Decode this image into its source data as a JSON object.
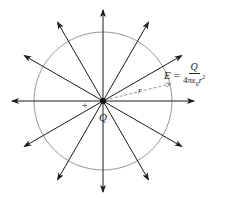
{
  "diagram": {
    "center": {
      "x": 103,
      "y": 101
    },
    "circle_radius": 69,
    "field_line_count": 12,
    "field_line_angles_deg": [
      0,
      30,
      60,
      90,
      120,
      150,
      180,
      210,
      240,
      270,
      300,
      330
    ],
    "line_length": 91,
    "colors": {
      "line": "#1a1a1a",
      "circle": "#8a8a8a",
      "radius": "#777777",
      "text": "#222222"
    },
    "labels": {
      "charge": "Q",
      "sign": "+",
      "radius": "r",
      "formula_lhs": "E",
      "formula_eq": "=",
      "formula_numerator": "Q",
      "formula_denominator_prefix": "4πε",
      "formula_denominator_sub": "0",
      "formula_denominator_var": "r",
      "formula_denominator_sup": "2"
    }
  }
}
